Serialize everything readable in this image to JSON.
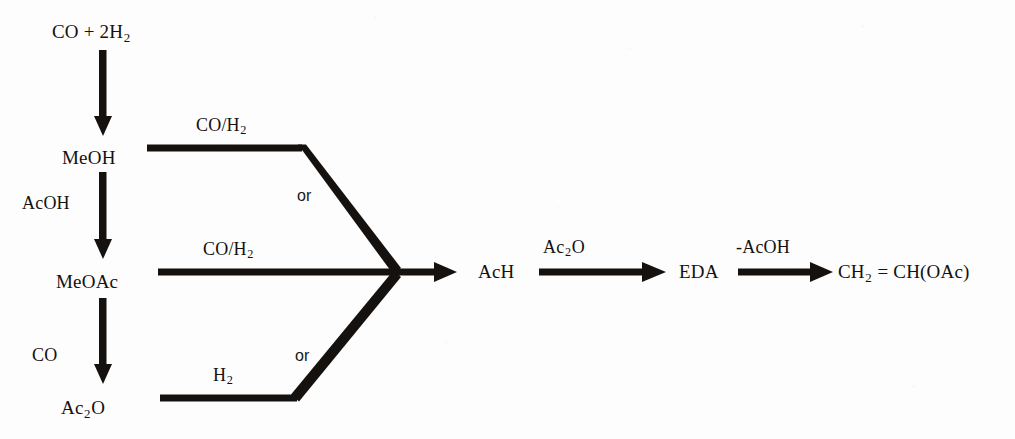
{
  "diagram": {
    "ink_color": "#14110f",
    "background_color": "#fdfdfd"
  },
  "nodes": {
    "syngas": {
      "main": "CO  +  2H",
      "sub": "2"
    },
    "methanol": {
      "main": "MeOH",
      "sub": ""
    },
    "methyl_acetate": {
      "main": "MeOAc",
      "sub": ""
    },
    "acetic_anhydride": {
      "main": "Ac",
      "sub": "2",
      "tail": "O"
    },
    "acetaldehyde": {
      "main": "AcH",
      "sub": ""
    },
    "eda": {
      "main": "EDA",
      "sub": ""
    },
    "vinyl_acetate": {
      "main": "CH",
      "sub": "2",
      "tail": " =  CH(OAc)"
    }
  },
  "conditions": {
    "acoh": {
      "text": "AcOH"
    },
    "co": {
      "text": "CO"
    },
    "syngas_top": {
      "main": "CO/H",
      "sub": "2"
    },
    "syngas_mid": {
      "main": "CO/H",
      "sub": "2"
    },
    "hydrogen": {
      "main": "H",
      "sub": "2"
    },
    "ac2o": {
      "main": "Ac",
      "sub": "2",
      "tail": "O"
    },
    "minus_acoh": {
      "text": "-AcOH"
    }
  },
  "connectors": {
    "or_upper": "or",
    "or_lower": "or"
  }
}
